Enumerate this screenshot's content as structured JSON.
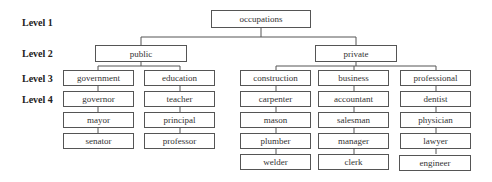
{
  "levels": [
    "Level 1",
    "Level 2",
    "Level 3",
    "Level 4"
  ],
  "root": "occupations",
  "sectors": [
    {
      "label": "public",
      "categories": [
        {
          "label": "government",
          "jobs": [
            "governor",
            "mayor",
            "senator"
          ]
        },
        {
          "label": "education",
          "jobs": [
            "teacher",
            "principal",
            "professor"
          ]
        }
      ]
    },
    {
      "label": "private",
      "categories": [
        {
          "label": "construction",
          "jobs": [
            "carpenter",
            "mason",
            "plumber",
            "welder"
          ]
        },
        {
          "label": "business",
          "jobs": [
            "accountant",
            "salesman",
            "manager",
            "clerk"
          ]
        },
        {
          "label": "professional",
          "jobs": [
            "dentist",
            "physician",
            "lawyer",
            "engineer"
          ]
        }
      ]
    }
  ]
}
